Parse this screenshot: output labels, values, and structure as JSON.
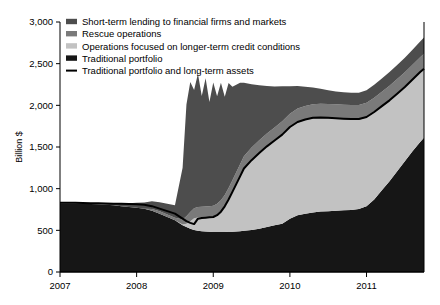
{
  "chart_data": {
    "type": "area",
    "title": "",
    "subtitle": "",
    "xlabel": "",
    "ylabel": "Billion $",
    "xlim": [
      2007.0,
      2011.75
    ],
    "ylim": [
      0,
      3000
    ],
    "ytick_labels": [
      "0",
      "500",
      "1,000",
      "1,500",
      "2,000",
      "2,500",
      "3,000"
    ],
    "ytick_values": [
      0,
      500,
      1000,
      1500,
      2000,
      2500,
      3000
    ],
    "xtick_labels": [
      "2007",
      "2008",
      "2009",
      "2010",
      "2011"
    ],
    "xtick_values": [
      2007,
      2008,
      2009,
      2010,
      2011
    ],
    "grid": false,
    "legend_position": "top-left",
    "stacking_order_bottom_to_top": [
      "Traditional portfolio",
      "Operations focused on longer-term credit conditions",
      "Rescue operations",
      "Short-term lending to financial firms and markets"
    ],
    "legend": [
      {
        "label": "Short-term lending to financial firms and markets",
        "color": "#4d4d4d",
        "marker": "swatch"
      },
      {
        "label": "Rescue operations",
        "color": "#7a7a7a",
        "marker": "swatch"
      },
      {
        "label": "Operations focused on longer-term credit conditions",
        "color": "#c2c2c2",
        "marker": "swatch"
      },
      {
        "label": "Traditional portfolio",
        "color": "#161616",
        "marker": "swatch"
      },
      {
        "label": "Traditional portfolio and long-term assets",
        "color": "#000000",
        "marker": "line"
      }
    ],
    "x": [
      2007.0,
      2007.1,
      2007.2,
      2007.3,
      2007.4,
      2007.5,
      2007.6,
      2007.7,
      2007.8,
      2007.9,
      2008.0,
      2008.1,
      2008.2,
      2008.3,
      2008.4,
      2008.5,
      2008.6,
      2008.65,
      2008.7,
      2008.75,
      2008.8,
      2008.85,
      2008.9,
      2008.95,
      2009.0,
      2009.05,
      2009.1,
      2009.15,
      2009.2,
      2009.25,
      2009.3,
      2009.35,
      2009.4,
      2009.5,
      2009.6,
      2009.7,
      2009.8,
      2009.9,
      2010.0,
      2010.1,
      2010.2,
      2010.3,
      2010.4,
      2010.5,
      2010.6,
      2010.7,
      2010.8,
      2010.9,
      2011.0,
      2011.1,
      2011.2,
      2011.3,
      2011.4,
      2011.5,
      2011.6,
      2011.7,
      2011.75
    ],
    "series": [
      {
        "name": "Traditional portfolio",
        "color": "#161616",
        "values": [
          820,
          822,
          820,
          818,
          815,
          812,
          808,
          800,
          790,
          780,
          770,
          760,
          735,
          700,
          660,
          620,
          560,
          540,
          520,
          505,
          495,
          490,
          485,
          482,
          480,
          480,
          480,
          481,
          482,
          484,
          486,
          490,
          495,
          505,
          520,
          540,
          560,
          580,
          640,
          680,
          700,
          715,
          725,
          730,
          735,
          740,
          745,
          755,
          790,
          870,
          980,
          1090,
          1210,
          1330,
          1450,
          1560,
          1610
        ]
      },
      {
        "name": "Operations focused on longer-term credit conditions",
        "color": "#c2c2c2",
        "values": [
          0,
          0,
          0,
          0,
          0,
          0,
          0,
          0,
          0,
          0,
          0,
          0,
          0,
          0,
          0,
          0,
          10,
          40,
          90,
          140,
          160,
          165,
          170,
          175,
          180,
          200,
          240,
          300,
          380,
          470,
          560,
          650,
          740,
          830,
          900,
          960,
          1010,
          1060,
          1090,
          1110,
          1120,
          1125,
          1120,
          1110,
          1100,
          1090,
          1080,
          1070,
          1060,
          1040,
          1000,
          960,
          920,
          880,
          850,
          830,
          820
        ]
      },
      {
        "name": "Rescue operations",
        "color": "#7a7a7a",
        "values": [
          0,
          0,
          0,
          0,
          0,
          0,
          0,
          0,
          0,
          0,
          0,
          0,
          20,
          28,
          30,
          30,
          60,
          90,
          110,
          120,
          125,
          128,
          130,
          132,
          135,
          138,
          140,
          142,
          145,
          148,
          150,
          152,
          155,
          158,
          160,
          162,
          165,
          168,
          170,
          172,
          173,
          174,
          175,
          176,
          177,
          178,
          179,
          180,
          181,
          182,
          183,
          184,
          185,
          186,
          187,
          188,
          190
        ]
      },
      {
        "name": "Short-term lending to financial firms and markets",
        "color": "#4d4d4d",
        "values": [
          10,
          10,
          10,
          10,
          10,
          12,
          15,
          20,
          30,
          45,
          60,
          75,
          95,
          110,
          130,
          150,
          620,
          1340,
          1560,
          1420,
          1600,
          1330,
          1540,
          1250,
          1480,
          1290,
          1410,
          1180,
          1260,
          1120,
          1050,
          980,
          880,
          760,
          660,
          570,
          490,
          420,
          330,
          270,
          230,
          200,
          180,
          165,
          155,
          150,
          148,
          146,
          150,
          155,
          160,
          165,
          170,
          175,
          180,
          188,
          195
        ]
      }
    ],
    "line_series": {
      "name": "Traditional portfolio and long-term assets",
      "color": "#000000",
      "values": [
        830,
        832,
        830,
        828,
        826,
        824,
        822,
        820,
        818,
        816,
        812,
        806,
        790,
        760,
        730,
        700,
        640,
        610,
        590,
        575,
        640,
        648,
        652,
        656,
        660,
        682,
        724,
        788,
        870,
        962,
        1055,
        1148,
        1242,
        1342,
        1428,
        1508,
        1578,
        1648,
        1740,
        1800,
        1830,
        1850,
        1855,
        1850,
        1845,
        1840,
        1835,
        1835,
        1860,
        1920,
        1990,
        2060,
        2140,
        2220,
        2310,
        2400,
        2440
      ]
    }
  }
}
